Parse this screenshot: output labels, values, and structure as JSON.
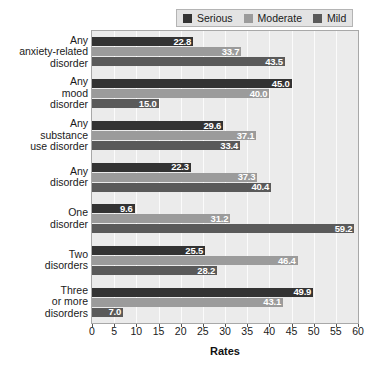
{
  "chart_data": {
    "type": "bar",
    "orientation": "horizontal",
    "title": "",
    "xlabel": "Rates",
    "ylabel": "",
    "xlim": [
      0,
      60
    ],
    "xticks": [
      0,
      5,
      10,
      15,
      20,
      25,
      30,
      35,
      40,
      45,
      50,
      55,
      60
    ],
    "grid": true,
    "legend_position": "top-right",
    "categories": [
      "Any anxiety-related disorder",
      "Any mood disorder",
      "Any substance use disorder",
      "Any disorder",
      "One disorder",
      "Two disorders",
      "Three or more disorders"
    ],
    "series": [
      {
        "name": "Serious",
        "color": "#333333",
        "values": [
          22.8,
          45.0,
          29.6,
          22.3,
          9.6,
          25.5,
          49.9
        ]
      },
      {
        "name": "Moderate",
        "color": "#9b9b9b",
        "values": [
          33.7,
          40.0,
          37.1,
          37.3,
          31.2,
          46.4,
          43.1
        ]
      },
      {
        "name": "Mild",
        "color": "#5a5a5a",
        "values": [
          43.5,
          15.0,
          33.4,
          40.4,
          59.2,
          28.2,
          7.0
        ]
      }
    ]
  },
  "legend": {
    "entries": [
      {
        "label": "Serious",
        "swatch": "legend-swatch-serious"
      },
      {
        "label": "Moderate",
        "swatch": "legend-swatch-moderate"
      },
      {
        "label": "Mild",
        "swatch": "legend-swatch-mild"
      }
    ]
  },
  "category_labels": [
    {
      "lines": [
        "Any",
        "anxiety-related",
        "disorder"
      ]
    },
    {
      "lines": [
        "Any",
        "mood",
        "disorder"
      ]
    },
    {
      "lines": [
        "Any",
        "substance",
        "use disorder"
      ]
    },
    {
      "lines": [
        "Any",
        "disorder"
      ]
    },
    {
      "lines": [
        "One",
        "disorder"
      ]
    },
    {
      "lines": [
        "Two",
        "disorders"
      ]
    },
    {
      "lines": [
        "Three",
        "or more",
        "disorders"
      ]
    }
  ],
  "axis": {
    "title": "Rates",
    "tick_labels": [
      "0",
      "5",
      "10",
      "15",
      "20",
      "25",
      "30",
      "35",
      "40",
      "45",
      "50",
      "55",
      "60"
    ]
  },
  "bar_labels": [
    [
      "22.8",
      "33.7",
      "43.5"
    ],
    [
      "45.0",
      "40.0",
      "15.0"
    ],
    [
      "29.6",
      "37.1",
      "33.4"
    ],
    [
      "22.3",
      "37.3",
      "40.4"
    ],
    [
      "9.6",
      "31.2",
      "59.2"
    ],
    [
      "25.5",
      "46.4",
      "28.2"
    ],
    [
      "49.9",
      "43.1",
      "7.0"
    ]
  ]
}
